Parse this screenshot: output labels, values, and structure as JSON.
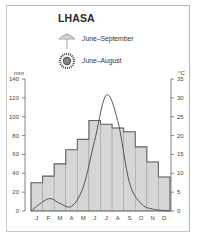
{
  "title": "LHASA",
  "legend": [
    {
      "icon": "umbrella-icon",
      "label": "June–September"
    },
    {
      "icon": "sun-icon",
      "label": "June–August"
    }
  ],
  "axes": {
    "left_unit": "mm",
    "right_unit": "°C"
  },
  "colors": {
    "bar_fill": "#d6d6d6",
    "bar_stroke": "#666666",
    "line": "#555555",
    "axis": "#666666"
  },
  "chart_data": {
    "type": "bar",
    "title": "LHASA",
    "categories": [
      "J",
      "F",
      "M",
      "A",
      "M",
      "J",
      "J",
      "A",
      "S",
      "O",
      "N",
      "D"
    ],
    "series": [
      {
        "name": "Temperature (°C)",
        "type": "bar",
        "axis": "right",
        "values": [
          7.5,
          9.25,
          12.5,
          16.25,
          19,
          24,
          23,
          22,
          21,
          17,
          13,
          9
        ]
      },
      {
        "name": "Precipitation (mm)",
        "type": "line",
        "axis": "left",
        "values": [
          0,
          13,
          8,
          5,
          25,
          75,
          123,
          95,
          30,
          8,
          2,
          0
        ]
      }
    ],
    "left_axis": {
      "label": "mm",
      "ticks": [
        0,
        20,
        40,
        60,
        80,
        100,
        120,
        140
      ],
      "ylim": [
        0,
        140
      ]
    },
    "right_axis": {
      "label": "°C",
      "ticks": [
        0,
        5,
        10,
        15,
        20,
        25,
        30,
        35
      ],
      "ylim": [
        0,
        35
      ]
    },
    "legend": [
      "June–September (rainy season)",
      "June–August (sunny)"
    ],
    "grid": false
  }
}
